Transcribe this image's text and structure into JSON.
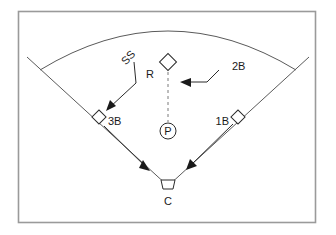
{
  "figure": {
    "kind": "baseball-field-diagram",
    "title": "",
    "frame": {
      "border_color": "#9a9a9a",
      "background": "#ffffff"
    },
    "field": {
      "line_color": "#5a5a5a",
      "outfield_fence": "arc",
      "foul_lines": 2
    },
    "positions": [
      {
        "id": "second-base",
        "label": "R",
        "shape": "diamond",
        "x": 168,
        "y": 62
      },
      {
        "id": "third-base",
        "label": "3B",
        "shape": "diamond",
        "x": 99,
        "y": 117
      },
      {
        "id": "first-base",
        "label": "1B",
        "shape": "diamond",
        "x": 238,
        "y": 117
      },
      {
        "id": "pitchers-mound",
        "label": "P",
        "shape": "circle",
        "x": 168,
        "y": 131
      },
      {
        "id": "home-plate",
        "label": "C",
        "shape": "home-plate",
        "x": 168,
        "y": 186
      }
    ],
    "annotations": [
      {
        "id": "shortstop-callout",
        "label": "SS",
        "rotation": -48,
        "points_to": "third-base"
      },
      {
        "id": "secondbase-callout",
        "label": "2B",
        "rotation": 0,
        "points_to": "second-base"
      }
    ],
    "movement_arrows": [
      {
        "id": "third-to-home",
        "from": "third-base",
        "to": "home-plate",
        "style": "solid"
      },
      {
        "id": "first-to-home",
        "from": "first-base",
        "to": "home-plate",
        "style": "solid"
      },
      {
        "id": "second-to-pitcher",
        "from": "second-base",
        "to": "pitchers-mound",
        "style": "dashed"
      }
    ],
    "labels": {
      "runner": "R",
      "pitcher": "P",
      "catcher": "C",
      "first_base": "1B",
      "third_base": "3B",
      "second_baseman": "2B",
      "shortstop": "SS"
    },
    "colors": {
      "ink": "#1a1a1a",
      "field": "#5a5a5a",
      "dashed": "#7a7a7a",
      "frame": "#9a9a9a"
    }
  }
}
